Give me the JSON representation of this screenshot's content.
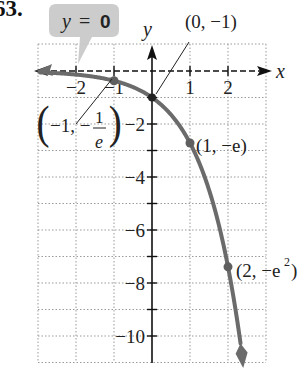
{
  "problem_number": "63.",
  "callout": {
    "text_var": "y",
    "text_eq": " = ",
    "text_val": "0",
    "fill": "#c9c9c9"
  },
  "axes": {
    "x_label": "x",
    "y_label": "y"
  },
  "x_ticks": [
    {
      "value": -2,
      "label": "−2"
    },
    {
      "value": -1,
      "label": "−1"
    },
    {
      "value": 1,
      "label": "1"
    },
    {
      "value": 2,
      "label": "2"
    }
  ],
  "y_ticks": [
    {
      "value": -2,
      "label": "−2"
    },
    {
      "value": -4,
      "label": "−4"
    },
    {
      "value": -6,
      "label": "−6"
    },
    {
      "value": -8,
      "label": "−8"
    },
    {
      "value": -10,
      "label": "−10"
    }
  ],
  "annotations": {
    "p0": "(0, −1)",
    "pneg1_a": "−1, −",
    "pneg1_num": "1",
    "pneg1_den": "e",
    "p1": "(1, −e)",
    "p2_a": "(2, −e",
    "p2_sup": "2",
    "p2_b": ")"
  },
  "colors": {
    "curve": "#6b6b6b",
    "grid": "#9a9a9a",
    "axis": "#111111"
  },
  "chart_data": {
    "type": "line",
    "title": "",
    "function": "y = -e^x",
    "xlabel": "x",
    "ylabel": "y",
    "xlim": [
      -3,
      3
    ],
    "ylim": [
      -11,
      1
    ],
    "grid": true,
    "x_ticks": [
      -2,
      -1,
      1,
      2
    ],
    "y_ticks": [
      -2,
      -4,
      -6,
      -8,
      -10
    ],
    "series": [
      {
        "name": "y = -e^x",
        "x": [
          -3,
          -2,
          -1,
          0,
          1,
          2,
          2.4
        ],
        "y": [
          -0.05,
          -0.135,
          -0.368,
          -1,
          -2.718,
          -7.389,
          -11.02
        ]
      }
    ],
    "points": [
      {
        "x": -1,
        "y": -0.368,
        "label": "(−1, −1/e)"
      },
      {
        "x": 0,
        "y": -1,
        "label": "(0, −1)"
      },
      {
        "x": 1,
        "y": -2.718,
        "label": "(1, −e)"
      },
      {
        "x": 2,
        "y": -7.389,
        "label": "(2, −e²)"
      }
    ],
    "asymptote": {
      "type": "horizontal",
      "y": 0,
      "label": "y = 0"
    }
  }
}
